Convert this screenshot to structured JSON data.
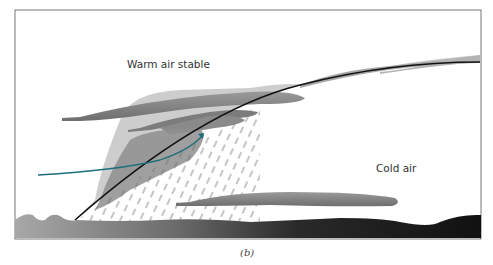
{
  "figure": {
    "caption": "(b)"
  },
  "labels": {
    "warm_air": "Warm air stable",
    "cold_air": "Cold air"
  },
  "colors": {
    "frame": "#555555",
    "front_line": "#111111",
    "arrow": "#1e6f7a",
    "cloud_dark": "#8a8a8a",
    "cloud_light": "#b8b8b8",
    "ground_light": "#9a9a9a",
    "ground_dark": "#1a1a1a",
    "rain": "#777777"
  }
}
